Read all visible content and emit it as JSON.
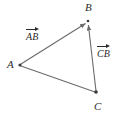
{
  "figure": {
    "type": "geometry-diagram",
    "background_color": "#ffffff",
    "stroke_color": "#6b6b6b",
    "text_color": "#2b2b2b",
    "width": 123,
    "height": 123,
    "vertices": [
      {
        "name": "A",
        "label": "A",
        "x": 20,
        "y": 65,
        "label_x": 7,
        "label_y": 59
      },
      {
        "name": "B",
        "label": "B",
        "x": 88,
        "y": 21,
        "label_x": 85,
        "label_y": 2
      },
      {
        "name": "C",
        "label": "C",
        "x": 96,
        "y": 93,
        "label_x": 94,
        "label_y": 101
      }
    ],
    "segments": [
      {
        "name": "AB",
        "from": "A",
        "to": "B",
        "arrow": true,
        "x1": 21,
        "y1": 64,
        "x2": 86,
        "y2": 23
      },
      {
        "name": "CB",
        "from": "C",
        "to": "B",
        "arrow": true,
        "x1": 96,
        "y1": 91,
        "x2": 88,
        "y2": 24
      },
      {
        "name": "AC",
        "from": "A",
        "to": "C",
        "arrow": false,
        "x1": 21,
        "y1": 66,
        "x2": 95,
        "y2": 92
      }
    ],
    "vector_labels": [
      {
        "name": "AB",
        "text": "AB",
        "overbar_arrow": true,
        "x": 26,
        "y": 27
      },
      {
        "name": "CB",
        "text": "CB",
        "overbar_arrow": true,
        "x": 97,
        "y": 44
      }
    ]
  }
}
